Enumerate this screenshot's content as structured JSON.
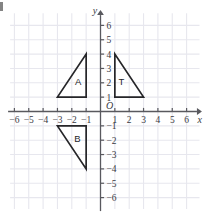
{
  "figure": {
    "type": "coordinate-plane",
    "width": 213,
    "height": 212,
    "background": "#ffffff",
    "grid_color": "#e7e7ee",
    "axis_color": "#59595e",
    "shape_color": "#262629",
    "label_color": "#3a3a3f"
  },
  "axes": {
    "x_label": "x",
    "y_label": "y",
    "origin_label": "O",
    "x_min": -6,
    "x_max": 6,
    "y_min": -6,
    "y_max": 6,
    "x_ticks": [
      "-6",
      "-5",
      "-4",
      "-3",
      "-2",
      "-1",
      "1",
      "2",
      "3",
      "4",
      "5",
      "6"
    ],
    "y_ticks": [
      "6",
      "5",
      "4",
      "3",
      "2",
      "1",
      "-1",
      "-2",
      "-3",
      "-4",
      "-5",
      "-6"
    ],
    "x_tick_values": [
      -6,
      -5,
      -4,
      -3,
      -2,
      -1,
      1,
      2,
      3,
      4,
      5,
      6
    ],
    "y_tick_values": [
      6,
      5,
      4,
      3,
      2,
      1,
      -1,
      -2,
      -3,
      -4,
      -5,
      -6
    ],
    "arrows": [
      "x-positive",
      "y-positive"
    ],
    "grid": true
  },
  "shapes": [
    {
      "name": "A",
      "label": "A",
      "type": "triangle",
      "vertices": [
        [
          -3,
          1
        ],
        [
          -1,
          1
        ],
        [
          -1,
          4
        ]
      ],
      "label_position": [
        -1.55,
        2.1
      ],
      "quadrant": 2
    },
    {
      "name": "T",
      "label": "T",
      "type": "triangle",
      "vertices": [
        [
          1,
          1
        ],
        [
          3,
          1
        ],
        [
          1,
          4
        ]
      ],
      "label_position": [
        1.45,
        2.1
      ],
      "quadrant": 1
    },
    {
      "name": "B",
      "label": "B",
      "type": "triangle",
      "vertices": [
        [
          -3,
          -1
        ],
        [
          -1,
          -1
        ],
        [
          -1,
          -4
        ]
      ],
      "label_position": [
        -1.6,
        -1.85
      ],
      "quadrant": 3
    }
  ]
}
